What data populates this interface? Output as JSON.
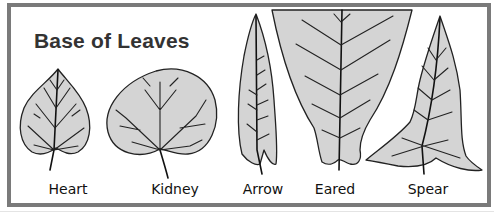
{
  "title": "Base of Leaves",
  "leaves": [
    {
      "label": "Heart",
      "x": 65
    },
    {
      "label": "Kidney",
      "x": 175
    },
    {
      "label": "Arrow",
      "x": 263
    },
    {
      "label": "Eared",
      "x": 335
    },
    {
      "label": "Spear",
      "x": 428
    }
  ],
  "colors": {
    "frame": "#7a7a7a",
    "leaf_fill": "#d4d4d4",
    "outline": "#222222",
    "title": "#333333"
  }
}
